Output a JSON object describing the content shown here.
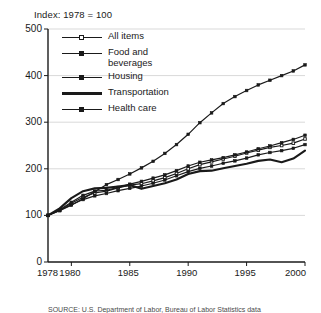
{
  "title": "Index: 1978 = 100",
  "source_note": "SOURCE: U.S. Department of Labor, Bureau of Labor Statistics data",
  "legend": {
    "items": [
      {
        "label": "All items",
        "marker": "open-square",
        "style": "line-with-marker"
      },
      {
        "label": "Food and\nbeverages",
        "marker": "filled-square",
        "style": "line-with-marker"
      },
      {
        "label": "Housing",
        "marker": "filled-square",
        "style": "line-with-marker"
      },
      {
        "label": "Transportation",
        "marker": "none",
        "style": "thick-line"
      },
      {
        "label": "Health care",
        "marker": "filled-square",
        "style": "line-with-marker"
      }
    ]
  },
  "axes": {
    "y_ticks": [
      "500",
      "400",
      "300",
      "200",
      "100",
      "0"
    ],
    "x_ticks": [
      "1978",
      "1980",
      "1985",
      "1990",
      "1995",
      "2000"
    ]
  },
  "chart_data": {
    "type": "line",
    "title": "Index: 1978 = 100",
    "xlabel": "",
    "ylabel": "Index: 1978 = 100",
    "xlim": [
      1978,
      2000
    ],
    "ylim": [
      0,
      500
    ],
    "grid": "horizontal",
    "legend_position": "upper-left-inside",
    "x": [
      1978,
      1979,
      1980,
      1981,
      1982,
      1983,
      1984,
      1985,
      1986,
      1987,
      1988,
      1989,
      1990,
      1991,
      1992,
      1993,
      1994,
      1995,
      1996,
      1997,
      1998,
      1999,
      2000
    ],
    "series": [
      {
        "name": "All items",
        "marker": "open-square",
        "values": [
          100,
          111,
          126,
          139,
          148,
          152,
          159,
          165,
          168,
          174,
          181,
          190,
          200,
          209,
          215,
          221,
          227,
          234,
          240,
          246,
          250,
          255,
          264
        ]
      },
      {
        "name": "Food and beverages",
        "marker": "filled-square",
        "values": [
          100,
          111,
          123,
          134,
          142,
          147,
          153,
          158,
          163,
          169,
          176,
          185,
          194,
          201,
          206,
          212,
          217,
          223,
          230,
          235,
          239,
          244,
          252
        ]
      },
      {
        "name": "Housing",
        "marker": "filled-square",
        "values": [
          100,
          112,
          128,
          143,
          152,
          154,
          160,
          167,
          173,
          180,
          187,
          196,
          206,
          214,
          219,
          224,
          230,
          236,
          243,
          249,
          256,
          263,
          272
        ]
      },
      {
        "name": "Transportation",
        "marker": "none",
        "values": [
          100,
          115,
          137,
          152,
          158,
          159,
          162,
          165,
          157,
          163,
          169,
          177,
          189,
          195,
          196,
          201,
          206,
          211,
          217,
          220,
          214,
          222,
          239
        ]
      },
      {
        "name": "Health care",
        "marker": "filled-square",
        "values": [
          100,
          110,
          122,
          136,
          151,
          166,
          177,
          189,
          202,
          216,
          233,
          252,
          274,
          299,
          320,
          340,
          355,
          368,
          380,
          390,
          400,
          410,
          423
        ]
      }
    ]
  }
}
